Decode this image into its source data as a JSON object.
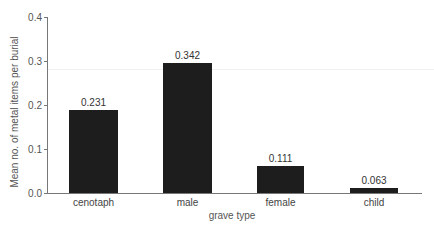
{
  "chart_data": {
    "type": "bar",
    "title": "",
    "xlabel": "grave type",
    "ylabel": "Mean no. of metal items per burial",
    "categories": [
      "cenotaph",
      "male",
      "female",
      "child"
    ],
    "values": [
      0.231,
      0.342,
      0.111,
      0.063
    ],
    "value_labels": [
      "0.231",
      "0.342",
      "0.111",
      "0.063"
    ],
    "bar_heights_read_from_axis": [
      0.188,
      0.295,
      0.061,
      0.012
    ],
    "ylim": [
      0.0,
      0.4
    ],
    "yticks": [
      "0.0",
      "0.1",
      "0.2",
      "0.3",
      "0.4"
    ],
    "grid": false,
    "legend": null,
    "bar_color": "#1d1d1d"
  },
  "axis": {
    "yticks": [
      {
        "label": "0.4",
        "y": 17
      },
      {
        "label": "0.3",
        "y": 61
      },
      {
        "label": "0.2",
        "y": 105
      },
      {
        "label": "0.1",
        "y": 149
      },
      {
        "label": "0.0",
        "y": 193
      }
    ]
  },
  "bars": [
    {
      "category": "cenotaph",
      "value_label": "0.231",
      "left": 69,
      "width": 49,
      "top": 110
    },
    {
      "category": "male",
      "value_label": "0.342",
      "left": 163,
      "width": 49,
      "top": 63
    },
    {
      "category": "female",
      "value_label": "0.111",
      "left": 257,
      "width": 47,
      "top": 166
    },
    {
      "category": "child",
      "value_label": "0.063",
      "left": 350,
      "width": 48,
      "top": 188
    }
  ]
}
